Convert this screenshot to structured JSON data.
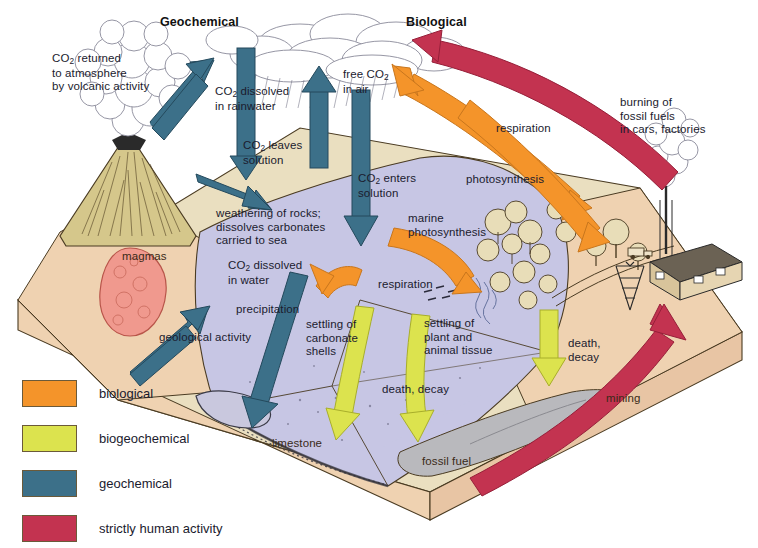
{
  "figure": {
    "headers": [
      {
        "id": "geochemical",
        "text": "Geochemical"
      },
      {
        "id": "biological",
        "text": "Biological"
      }
    ]
  },
  "labels": [
    {
      "id": "co2-returned-volcanic",
      "text": "CO2 returned\nto atmosphere\nby volcanic activity",
      "x": 52,
      "y": 52
    },
    {
      "id": "co2-dissolved-rainwater",
      "text": "CO2 dissolved\nin rainwater",
      "x": 215,
      "y": 85
    },
    {
      "id": "free-co2-in-air",
      "text": "free CO2\nin air",
      "x": 343,
      "y": 68
    },
    {
      "id": "burning-fossil-fuels",
      "text": "burning of\nfossil fuels\nin cars, factories",
      "x": 620,
      "y": 96
    },
    {
      "id": "co2-leaves-solution",
      "text": "CO2 leaves\nsolution",
      "x": 243,
      "y": 139
    },
    {
      "id": "respiration-land",
      "text": "respiration",
      "x": 496,
      "y": 122
    },
    {
      "id": "co2-enters-solution",
      "text": "CO2 enters\nsolution",
      "x": 358,
      "y": 172
    },
    {
      "id": "photosynthesis-land",
      "text": "photosynthesis",
      "x": 466,
      "y": 173
    },
    {
      "id": "weathering-of-rocks",
      "text": "weathering of rocks;\ndissolves carbonates\ncarried to sea",
      "x": 216,
      "y": 207
    },
    {
      "id": "marine-photosynthesis",
      "text": "marine\nphotosynthesis",
      "x": 408,
      "y": 212
    },
    {
      "id": "magmas",
      "text": "magmas",
      "x": 122,
      "y": 250
    },
    {
      "id": "co2-dissolved-in-water",
      "text": "CO2 dissolved\nin water",
      "x": 228,
      "y": 259
    },
    {
      "id": "respiration-marine",
      "text": "respiration",
      "x": 378,
      "y": 278
    },
    {
      "id": "precipitation",
      "text": "precipitation",
      "x": 236,
      "y": 303
    },
    {
      "id": "geological-activity",
      "text": "geological activity",
      "x": 159,
      "y": 331
    },
    {
      "id": "settling-carbonate-shells",
      "text": "settling of\ncarbonate\nshells",
      "x": 306,
      "y": 318
    },
    {
      "id": "settling-plant-animal-tissue",
      "text": "settling of\nplant and\nanimal tissue",
      "x": 424,
      "y": 317
    },
    {
      "id": "death-decay-land",
      "text": "death,\ndecay",
      "x": 568,
      "y": 337
    },
    {
      "id": "death-decay-ocean",
      "text": "death, decay",
      "x": 382,
      "y": 383
    },
    {
      "id": "mining",
      "text": "mining",
      "x": 606,
      "y": 392
    },
    {
      "id": "limestone",
      "text": "limestone",
      "x": 272,
      "y": 437
    },
    {
      "id": "fossil-fuel",
      "text": "fossil fuel",
      "x": 422,
      "y": 455
    }
  ],
  "legend": {
    "items": [
      {
        "id": "biological",
        "label": "biological",
        "color": "#F4942A"
      },
      {
        "id": "biogeochemical",
        "label": "biogeochemical",
        "color": "#DCE34E"
      },
      {
        "id": "geochemical",
        "label": "geochemical",
        "color": "#3C7089"
      },
      {
        "id": "human",
        "label": "strictly human activity",
        "color": "#C33350"
      }
    ]
  },
  "palette": {
    "ocean": "#C7C6E4",
    "ocean_deep": "#C2C1E0",
    "land_top": "#EADFC0",
    "land_side": "#EFD2B1",
    "volcano": "#D5C78B",
    "magma": "#F0998E",
    "fossil_layer": "#B9B9BD",
    "cloud": "#FFFFFF",
    "outline": "#4A3B22",
    "biological": "#F4942A",
    "biogeochemical": "#DCE34E",
    "geochemical": "#3C7089",
    "human": "#C33350",
    "tree": "#E8D9B0",
    "factory": "#D8C49B"
  }
}
